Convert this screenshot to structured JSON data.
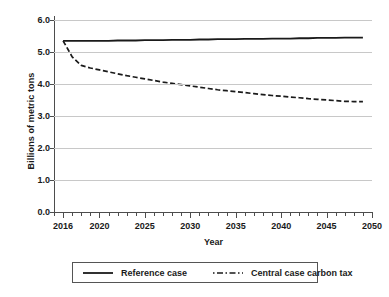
{
  "chart_data": {
    "type": "line",
    "title": "",
    "xlabel": "Year",
    "ylabel": "Billions of metric tons",
    "xlim": [
      2015,
      2050
    ],
    "ylim": [
      0.0,
      6.0
    ],
    "grid": true,
    "legend_position": "bottom",
    "y_ticks": [
      "0.0",
      "1.0",
      "2.0",
      "3.0",
      "4.0",
      "5.0",
      "6.0"
    ],
    "y_tick_values": [
      0.0,
      1.0,
      2.0,
      3.0,
      4.0,
      5.0,
      6.0
    ],
    "x_ticks": [
      "2016",
      "2020",
      "2025",
      "2030",
      "2035",
      "2040",
      "2045",
      "2050"
    ],
    "x_tick_values": [
      2016,
      2020,
      2025,
      2030,
      2035,
      2040,
      2045,
      2050
    ],
    "x_minor_tick_step": 1,
    "x": [
      2016,
      2017,
      2018,
      2019,
      2020,
      2021,
      2022,
      2023,
      2024,
      2025,
      2026,
      2027,
      2028,
      2029,
      2030,
      2031,
      2032,
      2033,
      2034,
      2035,
      2036,
      2037,
      2038,
      2039,
      2040,
      2041,
      2042,
      2043,
      2044,
      2045,
      2046,
      2047,
      2048,
      2049
    ],
    "series": [
      {
        "name": "Reference case",
        "style": "solid",
        "color": "#1a1a1a",
        "values": [
          5.35,
          5.35,
          5.35,
          5.35,
          5.35,
          5.35,
          5.36,
          5.36,
          5.36,
          5.37,
          5.37,
          5.37,
          5.38,
          5.38,
          5.38,
          5.39,
          5.39,
          5.4,
          5.4,
          5.4,
          5.41,
          5.41,
          5.41,
          5.42,
          5.42,
          5.42,
          5.43,
          5.43,
          5.44,
          5.44,
          5.44,
          5.45,
          5.45,
          5.45
        ]
      },
      {
        "name": "Central case carbon tax",
        "style": "dash-dot",
        "color": "#1a1a1a",
        "values": [
          5.35,
          4.85,
          4.58,
          4.5,
          4.44,
          4.38,
          4.32,
          4.26,
          4.21,
          4.16,
          4.11,
          4.06,
          4.02,
          3.98,
          3.94,
          3.9,
          3.86,
          3.82,
          3.79,
          3.76,
          3.73,
          3.7,
          3.67,
          3.64,
          3.62,
          3.59,
          3.57,
          3.54,
          3.52,
          3.5,
          3.48,
          3.46,
          3.45,
          3.45
        ]
      }
    ],
    "legend": [
      {
        "label": "Reference case",
        "style": "solid"
      },
      {
        "label": "Central case carbon tax",
        "style": "dash-dot"
      }
    ]
  }
}
